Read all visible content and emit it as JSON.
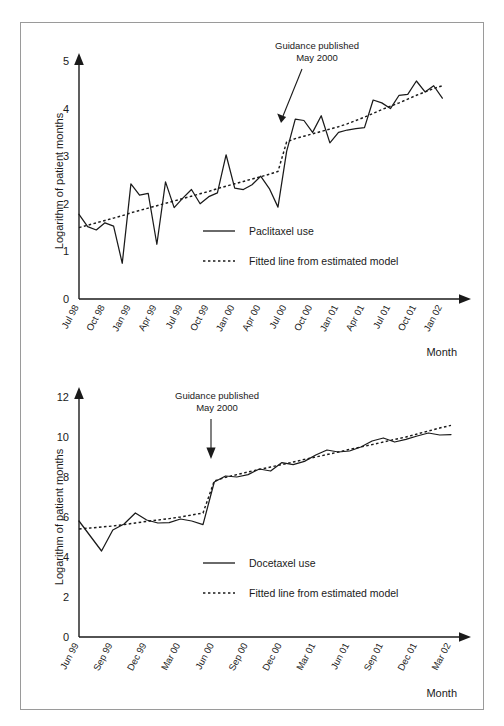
{
  "figure": {
    "border_color": "#9a9a9a",
    "ink_color": "#1a1a1a",
    "background": "#ffffff"
  },
  "chart_data": [
    {
      "type": "line",
      "id": "paclitaxel",
      "title": "",
      "xlabel": "Month",
      "ylabel": "Logarithm of patient months",
      "ylim": [
        0,
        5
      ],
      "yticks": [
        0,
        1,
        2,
        3,
        4,
        5
      ],
      "grid": false,
      "legend_position": "inside-bottom-right",
      "annotation": {
        "line1": "Guidance published",
        "line2": "May 2000",
        "points_to_x": "May 00",
        "points_to_y": 3.78
      },
      "xtick_labels": [
        "Jul 98",
        "Oct 98",
        "Jan 99",
        "Apr 99",
        "Jul 99",
        "Oct 99",
        "Jan 00",
        "Apr 00",
        "Jul 00",
        "Oct 00",
        "Jan 01",
        "Apr 01",
        "Jul 01",
        "Oct 01",
        "Jan 02"
      ],
      "x": [
        "Jul 98",
        "Aug 98",
        "Sep 98",
        "Oct 98",
        "Nov 98",
        "Dec 98",
        "Jan 99",
        "Feb 99",
        "Mar 99",
        "Apr 99",
        "May 99",
        "Jun 99",
        "Jul 99",
        "Aug 99",
        "Sep 99",
        "Oct 99",
        "Nov 99",
        "Dec 99",
        "Jan 00",
        "Feb 00",
        "Mar 00",
        "Apr 00",
        "May 00",
        "Jun 00",
        "Jul 00",
        "Aug 00",
        "Sep 00",
        "Oct 00",
        "Nov 00",
        "Dec 00",
        "Jan 01",
        "Feb 01",
        "Mar 01",
        "Apr 01",
        "May 01",
        "Jun 01",
        "Jul 01",
        "Aug 01",
        "Sep 01",
        "Oct 01",
        "Nov 01",
        "Dec 01",
        "Jan 02",
        "Feb 02"
      ],
      "series": [
        {
          "name": "Paclitaxel use",
          "style": "solid",
          "values": [
            1.78,
            1.52,
            1.45,
            1.6,
            1.53,
            0.75,
            2.42,
            2.18,
            2.22,
            1.15,
            2.46,
            1.92,
            2.12,
            2.3,
            2.0,
            2.15,
            2.23,
            3.03,
            2.33,
            2.3,
            2.4,
            2.58,
            2.32,
            1.93,
            3.1,
            3.78,
            3.75,
            3.5,
            3.85,
            3.28,
            3.5,
            3.55,
            3.58,
            3.6,
            4.18,
            4.12,
            4.0,
            4.28,
            4.3,
            4.58,
            4.35,
            4.48,
            4.22
          ]
        },
        {
          "name": "Fitted line from estimated model",
          "style": "dotted",
          "values": [
            1.5,
            1.55,
            1.6,
            1.65,
            1.7,
            1.75,
            1.81,
            1.86,
            1.91,
            1.96,
            2.01,
            2.06,
            2.11,
            2.16,
            2.21,
            2.26,
            2.32,
            2.37,
            2.42,
            2.47,
            2.52,
            2.57,
            2.62,
            2.68,
            3.3,
            3.37,
            3.42,
            3.47,
            3.52,
            3.57,
            3.62,
            3.68,
            3.75,
            3.82,
            3.9,
            3.98,
            4.05,
            4.12,
            4.2,
            4.28,
            4.35,
            4.42,
            4.48
          ]
        }
      ]
    },
    {
      "type": "line",
      "id": "docetaxel",
      "title": "",
      "xlabel": "Month",
      "ylabel": "Logarithm of patient months",
      "ylim": [
        0,
        12
      ],
      "yticks": [
        0,
        2,
        4,
        6,
        8,
        10,
        12
      ],
      "grid": false,
      "legend_position": "inside-bottom-right",
      "annotation": {
        "line1": "Guidance published",
        "line2": "May 2000",
        "points_to_x": "May 00",
        "points_to_y": 7.75
      },
      "xtick_labels": [
        "Jun 99",
        "Sep 99",
        "Dec 99",
        "Mar 00",
        "Jun 00",
        "Sep 00",
        "Dec 00",
        "Mar 01",
        "Jun 01",
        "Sep 01",
        "Dec 01",
        "Mar 02"
      ],
      "x": [
        "Jun 99",
        "Jul 99",
        "Aug 99",
        "Sep 99",
        "Oct 99",
        "Nov 99",
        "Dec 99",
        "Jan 00",
        "Feb 00",
        "Mar 00",
        "Apr 00",
        "May 00",
        "Jun 00",
        "Jul 00",
        "Aug 00",
        "Sep 00",
        "Oct 00",
        "Nov 00",
        "Dec 00",
        "Jan 01",
        "Feb 01",
        "Mar 01",
        "Apr 01",
        "May 01",
        "Jun 01",
        "Jul 01",
        "Aug 01",
        "Sep 01",
        "Oct 01",
        "Nov 01",
        "Dec 01",
        "Jan 02",
        "Feb 02",
        "Mar 02"
      ],
      "series": [
        {
          "name": "Docetaxel use",
          "style": "solid",
          "values": [
            5.8,
            5.05,
            4.3,
            5.35,
            5.65,
            6.2,
            5.85,
            5.7,
            5.72,
            5.9,
            5.8,
            5.62,
            7.75,
            8.05,
            8.0,
            8.12,
            8.4,
            8.3,
            8.72,
            8.62,
            8.78,
            9.1,
            9.35,
            9.25,
            9.3,
            9.5,
            9.8,
            9.95,
            9.75,
            9.88,
            10.05,
            10.2,
            10.1,
            10.12
          ]
        },
        {
          "name": "Fitted line from estimated model",
          "style": "dotted",
          "values": [
            5.4,
            5.45,
            5.5,
            5.55,
            5.62,
            5.7,
            5.78,
            5.85,
            5.92,
            6.0,
            6.1,
            6.2,
            7.8,
            7.98,
            8.12,
            8.25,
            8.38,
            8.5,
            8.62,
            8.75,
            8.88,
            9.0,
            9.12,
            9.25,
            9.38,
            9.5,
            9.62,
            9.75,
            9.88,
            10.0,
            10.15,
            10.3,
            10.45,
            10.58
          ]
        }
      ]
    }
  ],
  "panels": {
    "top": {
      "ylabel": "Logarithm of patient months",
      "xlabel": "Month",
      "annotation_line1": "Guidance published",
      "annotation_line2": "May 2000",
      "legend": {
        "solid_label": "Paclitaxel use",
        "dotted_label": "Fitted line from estimated model"
      }
    },
    "bottom": {
      "ylabel": "Logarithm of patient months",
      "xlabel": "Month",
      "annotation_line1": "Guidance published",
      "annotation_line2": "May 2000",
      "legend": {
        "solid_label": "Docetaxel use",
        "dotted_label": "Fitted line from estimated model"
      }
    }
  }
}
